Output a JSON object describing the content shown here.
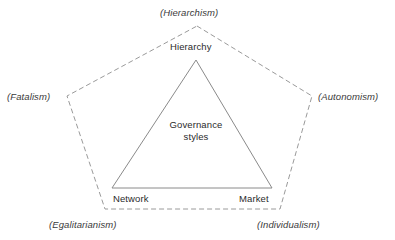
{
  "diagram": {
    "title": "Governance styles",
    "colors": {
      "background": "#ffffff",
      "stroke_triangle": "#8a8a8a",
      "stroke_pentagon": "#9a9a9a",
      "text": "#2b2b2b"
    },
    "center": {
      "line1": "Governance",
      "line2": "styles",
      "full": "Governance styles"
    },
    "inner_triangle": {
      "shape": "triangle",
      "line_style": "solid",
      "vertices": [
        {
          "name": "apex",
          "label": "Hierarchy",
          "x": 196,
          "y": 60
        },
        {
          "name": "bottom-left",
          "label": "Network",
          "x": 112,
          "y": 188
        },
        {
          "name": "bottom-right",
          "label": "Market",
          "x": 272,
          "y": 188
        }
      ]
    },
    "outer_pentagon": {
      "shape": "pentagon",
      "line_style": "dashed",
      "dash": "5 3",
      "vertices": [
        {
          "name": "top",
          "label": "(Hierarchism)",
          "x": 197,
          "y": 26
        },
        {
          "name": "left",
          "label": "(Fatalism)",
          "x": 67,
          "y": 96
        },
        {
          "name": "right",
          "label": "(Autonomism)",
          "x": 312,
          "y": 96
        },
        {
          "name": "bottom-left",
          "label": "(Egalitarianism)",
          "x": 105,
          "y": 209
        },
        {
          "name": "bottom-right",
          "label": "(Individualism)",
          "x": 280,
          "y": 209
        }
      ]
    },
    "labels": {
      "hierarchy": "Hierarchy",
      "network": "Network",
      "market": "Market",
      "hierarchism": "(Hierarchism)",
      "fatalism": "(Fatalism)",
      "autonomism": "(Autonomism)",
      "egalitarianism": "(Egalitarianism)",
      "individualism": "(Individualism)"
    }
  }
}
